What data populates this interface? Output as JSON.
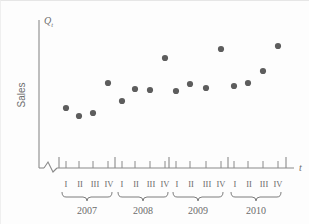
{
  "figure": {
    "y_axis_top_label": "Q",
    "y_axis_top_sub": "t",
    "y_axis_label": "Sales",
    "x_axis_label": "t",
    "axis_break_icon": "axis-break-zigzag"
  },
  "chart_data": {
    "type": "scatter",
    "title": "",
    "xlabel": "t",
    "ylabel": "Sales",
    "grid": false,
    "legend": false,
    "x_axis_broken": true,
    "categories": [
      "2007 I",
      "2007 II",
      "2007 III",
      "2007 IV",
      "2008 I",
      "2008 II",
      "2008 III",
      "2008 IV",
      "2009 I",
      "2009 II",
      "2009 III",
      "2009 IV",
      "2010 I",
      "2010 II",
      "2010 III",
      "2010 IV"
    ],
    "quarter_labels": [
      "I",
      "II",
      "III",
      "IV"
    ],
    "year_labels": [
      "2007",
      "2008",
      "2009",
      "2010"
    ],
    "x": [
      1,
      2,
      3,
      4,
      5,
      6,
      7,
      8,
      9,
      10,
      11,
      12,
      13,
      14,
      15,
      16
    ],
    "values": [
      38,
      30,
      33,
      72,
      45,
      57,
      56,
      89,
      55,
      62,
      59,
      99,
      60,
      63,
      76,
      103
    ],
    "ylim": [
      0,
      120
    ],
    "points_px": [
      {
        "cx": 66,
        "cy": 108
      },
      {
        "cx": 79,
        "cy": 116
      },
      {
        "cx": 93,
        "cy": 113
      },
      {
        "cx": 108,
        "cy": 83
      },
      {
        "cx": 122,
        "cy": 101
      },
      {
        "cx": 135,
        "cy": 89
      },
      {
        "cx": 150,
        "cy": 90
      },
      {
        "cx": 165,
        "cy": 58
      },
      {
        "cx": 176,
        "cy": 91
      },
      {
        "cx": 190,
        "cy": 84
      },
      {
        "cx": 206,
        "cy": 88
      },
      {
        "cx": 221,
        "cy": 49
      },
      {
        "cx": 234,
        "cy": 86
      },
      {
        "cx": 248,
        "cy": 83
      },
      {
        "cx": 263,
        "cy": 71
      },
      {
        "cx": 278,
        "cy": 46
      }
    ],
    "tick_px": [
      66,
      79,
      93,
      108,
      122,
      135,
      150,
      165,
      176,
      190,
      206,
      221,
      234,
      248,
      263,
      278
    ],
    "year_divider_px": [
      59,
      115,
      169,
      228,
      286
    ],
    "year_center_px": [
      87,
      143,
      198,
      256
    ]
  },
  "colors": {
    "dot": "#5d5d5d",
    "axis": "#8a8a8a",
    "text": "#6d6d6d",
    "background": "#fdfdfd"
  }
}
